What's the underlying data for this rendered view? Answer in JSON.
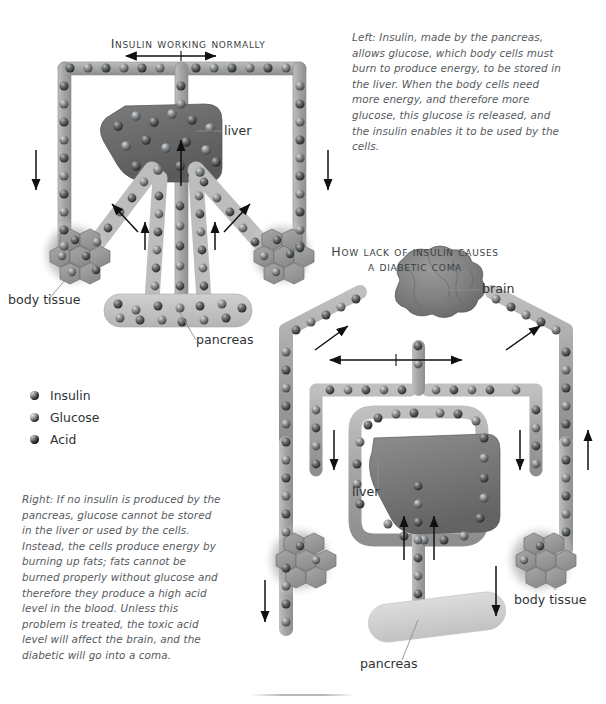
{
  "page": {
    "background": "#ffffff"
  },
  "diagram_normal": {
    "title": "How insulin works normally",
    "title_display": "Insulin working normally",
    "labels": {
      "liver": "liver",
      "body_tissue": "body tissue",
      "pancreas": "pancreas"
    }
  },
  "diagram_coma": {
    "title_line1": "How lack of insulin causes",
    "title_line2": "a diabetic coma",
    "labels": {
      "brain": "brain",
      "liver": "liver",
      "body_tissue": "body tissue",
      "pancreas": "pancreas"
    }
  },
  "captions": {
    "left": "Left: Insulin, made by the pancreas, allows glucose, which body cells must burn to produce energy, to be stored in the liver. When the body cells need more energy, and therefore more glucose, this glucose is released, and the insulin enables it to be used by the cells.",
    "right": "Right: If no insulin is produced by the pancreas, glucose cannot be stored in the liver or used by the cells. Instead, the cells produce energy by burning up fats; fats cannot be burned properly without glucose and therefore they produce a high acid level in the blood. Unless this problem is treated, the toxic acid level will affect the brain, and the diabetic will go into a coma."
  },
  "legend": {
    "items": [
      {
        "label": "Insulin",
        "color": "#3b3f42"
      },
      {
        "label": "Glucose",
        "color": "#55595c"
      },
      {
        "label": "Acid",
        "color": "#2a2d30"
      }
    ]
  },
  "colors": {
    "vessel_fill": "#a9a9a9",
    "vessel_stroke": "#8f8f8f",
    "organ_dark": "#6e6e6e",
    "organ_mid": "#8a8a8a",
    "organ_light": "#c3c3c3",
    "particle_dark": "#2f3234",
    "particle_mid": "#53585b",
    "text": "#2f3336",
    "caption_text": "#555a5e"
  }
}
